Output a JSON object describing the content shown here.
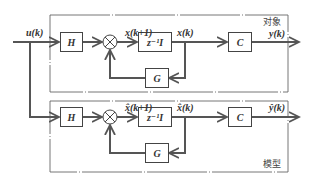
{
  "diagram": {
    "type": "block-diagram",
    "input": {
      "label": "u(k)"
    },
    "plant": {
      "frame_label": "对象",
      "blocks": {
        "input_gain": "H",
        "delay": "z⁻¹I",
        "feedback_gain": "G",
        "output_gain": "C"
      },
      "signals": {
        "next_state": "x(k+1)",
        "state": "x(k)",
        "output": "y(k)"
      }
    },
    "model": {
      "frame_label": "模型",
      "blocks": {
        "input_gain": "H",
        "delay": "z⁻¹I",
        "feedback_gain": "G",
        "output_gain": "C"
      },
      "signals": {
        "next_state": "x̂(k+1)",
        "state": "x̂(k)",
        "output": "ŷ(k)"
      }
    },
    "colors": {
      "line": "#555555",
      "frame": "#666666",
      "background": "#ffffff"
    }
  }
}
